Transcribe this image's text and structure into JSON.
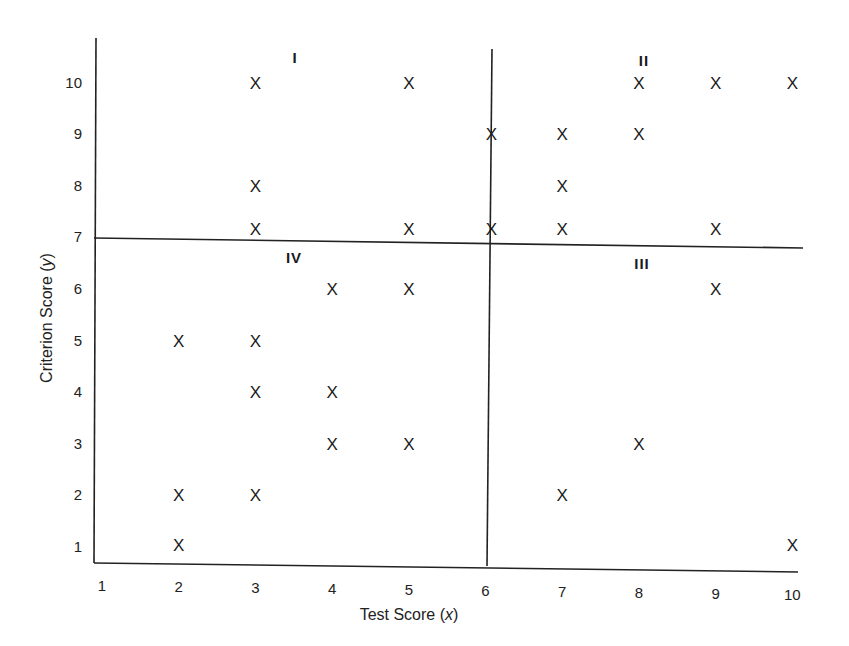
{
  "chart_data": {
    "type": "scatter",
    "title": "",
    "xlabel": "Test Score (x)",
    "ylabel": "Criterion Score (y)",
    "xlabel_parts": {
      "text": "Test Score (",
      "var": "x",
      "close": ")"
    },
    "ylabel_parts": {
      "text": "Criterion Score (",
      "var": "y",
      "close": ")"
    },
    "x_ticks": [
      1,
      2,
      3,
      4,
      5,
      6,
      7,
      8,
      9,
      10
    ],
    "y_ticks": [
      1,
      2,
      3,
      4,
      5,
      6,
      7,
      8,
      9,
      10
    ],
    "xlim": [
      1,
      10
    ],
    "ylim": [
      1,
      10
    ],
    "grid": false,
    "marker": "X",
    "cut_lines": {
      "test_cutoff_x": 6,
      "criterion_cutoff_y": 7
    },
    "quadrant_labels": [
      {
        "label": "I",
        "position": "upper-left"
      },
      {
        "label": "II",
        "position": "upper-right"
      },
      {
        "label": "III",
        "position": "lower-right"
      },
      {
        "label": "IV",
        "position": "lower-left"
      }
    ],
    "series": [
      {
        "name": "Quadrant I",
        "points": [
          [
            3,
            10
          ],
          [
            5,
            10
          ],
          [
            3,
            8
          ],
          [
            3,
            7
          ],
          [
            5,
            7
          ]
        ]
      },
      {
        "name": "Quadrant II",
        "points": [
          [
            8,
            10
          ],
          [
            9,
            10
          ],
          [
            10,
            10
          ],
          [
            6,
            9
          ],
          [
            7,
            9
          ],
          [
            8,
            9
          ],
          [
            7,
            8
          ],
          [
            6,
            7
          ],
          [
            7,
            7
          ],
          [
            9,
            7
          ]
        ]
      },
      {
        "name": "Quadrant III",
        "points": [
          [
            9,
            6
          ],
          [
            8,
            3
          ],
          [
            7,
            2
          ],
          [
            10,
            1
          ]
        ]
      },
      {
        "name": "Quadrant IV",
        "points": [
          [
            4,
            6
          ],
          [
            5,
            6
          ],
          [
            2,
            5
          ],
          [
            3,
            5
          ],
          [
            3,
            4
          ],
          [
            4,
            4
          ],
          [
            4,
            3
          ],
          [
            5,
            3
          ],
          [
            2,
            2
          ],
          [
            3,
            2
          ],
          [
            2,
            1
          ]
        ]
      }
    ]
  }
}
